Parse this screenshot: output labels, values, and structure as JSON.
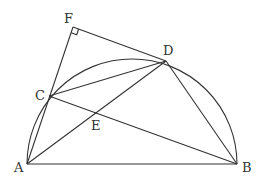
{
  "diagram": {
    "type": "geometry",
    "stroke_color": "#333333",
    "points": {
      "A": {
        "label": "A",
        "x": 27,
        "y": 164
      },
      "B": {
        "label": "B",
        "x": 237,
        "y": 164
      },
      "C": {
        "label": "C",
        "x": 49,
        "y": 96
      },
      "D": {
        "label": "D",
        "x": 166,
        "y": 61
      },
      "E": {
        "label": "E",
        "x": 96,
        "y": 113
      },
      "F": {
        "label": "F",
        "x": 73,
        "y": 27
      }
    },
    "segments": [
      "AB",
      "AF",
      "FD",
      "AD",
      "CD",
      "CB",
      "DB",
      "AC"
    ],
    "arc": {
      "from": "A",
      "to": "B",
      "center": [
        132,
        164
      ],
      "radius": 105
    },
    "right_angle_marker": "F"
  }
}
